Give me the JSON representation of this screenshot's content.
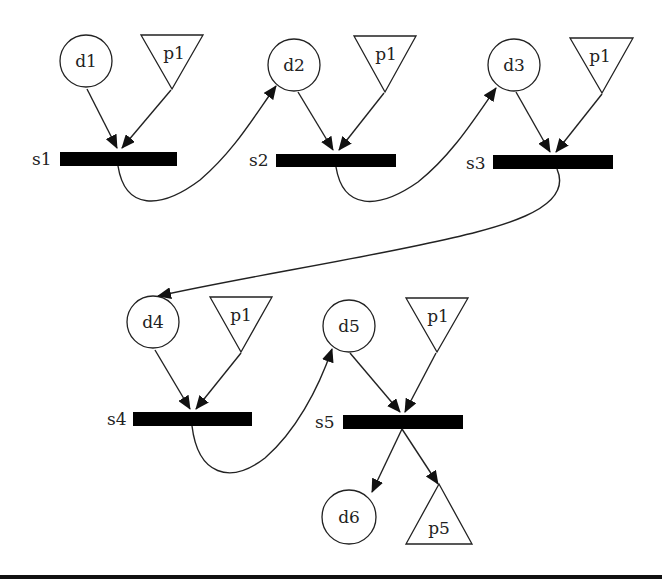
{
  "diagram": {
    "type": "petri-net-process-chain",
    "data_nodes": [
      {
        "id": "d1",
        "label": "d1",
        "cx": 86,
        "cy": 61
      },
      {
        "id": "d2",
        "label": "d2",
        "cx": 294,
        "cy": 65
      },
      {
        "id": "d3",
        "label": "d3",
        "cx": 514,
        "cy": 65
      },
      {
        "id": "d4",
        "label": "d4",
        "cx": 153,
        "cy": 322
      },
      {
        "id": "d5",
        "label": "d5",
        "cx": 349,
        "cy": 326
      },
      {
        "id": "d6",
        "label": "d6",
        "cx": 349,
        "cy": 517
      }
    ],
    "param_nodes": [
      {
        "id": "p1a",
        "label": "p1",
        "x1": 141,
        "x2": 203,
        "top": 34,
        "apex": 89,
        "dir": "down"
      },
      {
        "id": "p1b",
        "label": "p1",
        "x1": 354,
        "x2": 416,
        "top": 36,
        "apex": 92,
        "dir": "down"
      },
      {
        "id": "p1c",
        "label": "p1",
        "x1": 570,
        "x2": 633,
        "top": 38,
        "apex": 93,
        "dir": "down"
      },
      {
        "id": "p1d",
        "label": "p1",
        "x1": 210,
        "x2": 272,
        "top": 297,
        "apex": 352,
        "dir": "down"
      },
      {
        "id": "p1e",
        "label": "p1",
        "x1": 406,
        "x2": 468,
        "top": 298,
        "apex": 352,
        "dir": "down"
      },
      {
        "id": "p5",
        "label": "p5",
        "x1": 406,
        "x2": 472,
        "top": 484,
        "apex": 484,
        "base": 544,
        "dir": "up"
      }
    ],
    "steps": [
      {
        "id": "s1",
        "label": "s1",
        "x": 60,
        "y": 152,
        "w": 117,
        "h": 14
      },
      {
        "id": "s2",
        "label": "s2",
        "x": 276,
        "y": 154,
        "w": 120,
        "h": 13
      },
      {
        "id": "s3",
        "label": "s3",
        "x": 493,
        "y": 155,
        "w": 120,
        "h": 14
      },
      {
        "id": "s4",
        "label": "s4",
        "x": 133,
        "y": 412,
        "w": 119,
        "h": 14
      },
      {
        "id": "s5",
        "label": "s5",
        "x": 343,
        "y": 415,
        "w": 120,
        "h": 14
      }
    ],
    "edges": [
      {
        "from": "d1",
        "to": "s1"
      },
      {
        "from": "p1a",
        "to": "s1"
      },
      {
        "from": "s1",
        "to": "d2"
      },
      {
        "from": "d2",
        "to": "s2"
      },
      {
        "from": "p1b",
        "to": "s2"
      },
      {
        "from": "s2",
        "to": "d3"
      },
      {
        "from": "d3",
        "to": "s3"
      },
      {
        "from": "p1c",
        "to": "s3"
      },
      {
        "from": "s3",
        "to": "d4"
      },
      {
        "from": "d4",
        "to": "s4"
      },
      {
        "from": "p1d",
        "to": "s4"
      },
      {
        "from": "s4",
        "to": "d5"
      },
      {
        "from": "d5",
        "to": "s5"
      },
      {
        "from": "p1e",
        "to": "s5"
      },
      {
        "from": "s5",
        "to": "d6"
      },
      {
        "from": "s5",
        "to": "p5"
      }
    ],
    "colors": {
      "stroke": "#222222",
      "bar": "#000000",
      "background": "#ffffff"
    }
  }
}
